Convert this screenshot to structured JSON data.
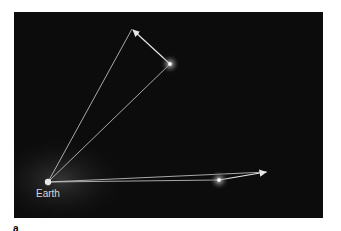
{
  "figure": {
    "panel_label": "a",
    "earth_label": "Earth",
    "colors": {
      "background": "#0c0c0c",
      "lines": "#d9d9d9",
      "star": "#ffffff"
    },
    "points": {
      "earth": [
        48,
        182
      ],
      "star1": [
        170,
        64
      ],
      "star1_arrow_tip": [
        132,
        29
      ],
      "star2": [
        219,
        180
      ],
      "star2_arrow_tip": [
        267,
        172
      ]
    }
  }
}
